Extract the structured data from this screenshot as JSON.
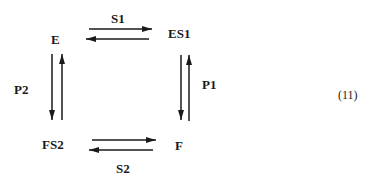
{
  "diagram": {
    "equation_number": "(11)",
    "nodes": {
      "E": "E",
      "ES1": "ES1",
      "F": "F",
      "FS2": "FS2"
    },
    "edges": {
      "S1": "S1",
      "P1": "P1",
      "S2": "S2",
      "P2": "P2"
    },
    "relations": [
      {
        "from": "E",
        "to": "ES1",
        "label": "S1",
        "reversible": true
      },
      {
        "from": "ES1",
        "to": "F",
        "label": "P1",
        "reversible": true
      },
      {
        "from": "F",
        "to": "FS2",
        "label": "S2",
        "reversible": true
      },
      {
        "from": "FS2",
        "to": "E",
        "label": "P2",
        "reversible": true
      }
    ],
    "colors": {
      "ink": "#1a1a1a",
      "background": "#ffffff"
    }
  }
}
